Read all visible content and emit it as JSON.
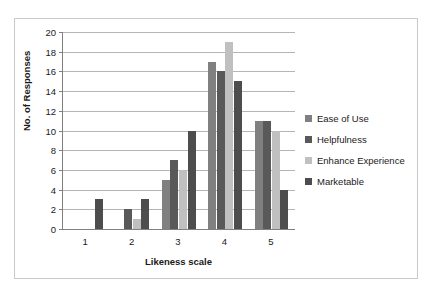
{
  "chart_data": {
    "type": "bar",
    "title": "",
    "xlabel": "Likeness scale",
    "ylabel": "No. of Responses",
    "categories": [
      "1",
      "2",
      "3",
      "4",
      "5"
    ],
    "ylim": [
      0,
      20
    ],
    "ytick_step": 2,
    "yticks": [
      "20",
      "18",
      "16",
      "14",
      "12",
      "10",
      "8",
      "6",
      "4",
      "2",
      "0"
    ],
    "grid": true,
    "legend_position": "right",
    "series": [
      {
        "name": "Ease of Use",
        "color": "#808080",
        "values": [
          0,
          0,
          5,
          17,
          11
        ]
      },
      {
        "name": "Helpfulness",
        "color": "#595959",
        "values": [
          0,
          2,
          7,
          16,
          11
        ]
      },
      {
        "name": "Enhance Experience",
        "color": "#c0c0c0",
        "values": [
          0,
          1,
          6,
          19,
          10
        ]
      },
      {
        "name": "Marketable",
        "color": "#4d4d4d",
        "values": [
          3,
          3,
          10,
          15,
          4
        ]
      }
    ]
  },
  "figure": {
    "background": "#ffffff",
    "frame_color": "#c9c9c9",
    "axis_color": "#808080",
    "grid_color": "#b5b5b5",
    "text_color": "#1a1a1a"
  }
}
